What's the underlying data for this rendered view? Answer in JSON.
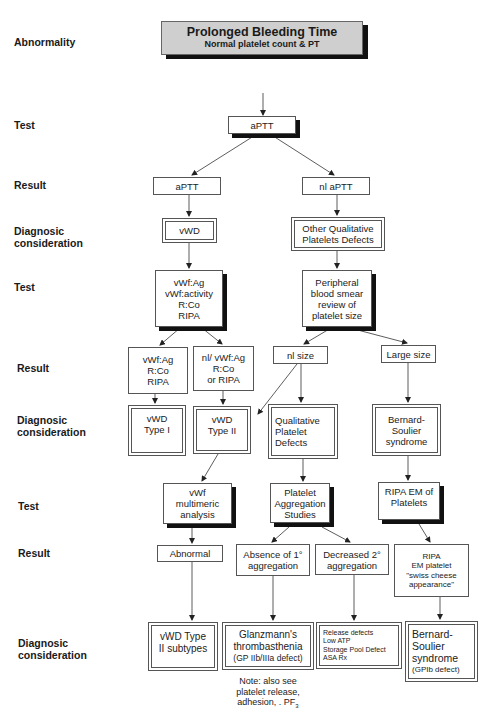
{
  "title": {
    "main": "Prolonged Bleeding Time",
    "sub": "Normal platelet count & PT"
  },
  "row_labels": {
    "abnormality": "Abnormality",
    "test1": "Test",
    "result1": "Result",
    "diag1_line1": "Diagnosic",
    "diag1_line2": "consideration",
    "test2": "Test",
    "result2": "Result",
    "diag2_line1": "Diagnosic",
    "diag2_line2": "consideration",
    "test3": "Test",
    "result3": "Result",
    "diag3_line1": "Diagnosic",
    "diag3_line2": "consideration"
  },
  "nodes": {
    "test_aptt": "aPTT",
    "result_aptt": "aPTT",
    "result_nl_aptt": "nl  aPTT",
    "diag_vwd": "vWD",
    "diag_other_qual": [
      "Other Qualitative",
      "Platelets Defects"
    ],
    "test_vwf": [
      "vWf:Ag",
      "vWf:activity",
      "R:Co",
      "RIPA"
    ],
    "test_smear": [
      "Peripheral",
      "blood smear",
      "review of",
      "platelet size"
    ],
    "result_vwf_low": [
      "vWf:Ag",
      "R:Co",
      "RIPA"
    ],
    "result_vwf_nl": [
      "nl/  vWf:Ag",
      "R:Co",
      "or  RIPA"
    ],
    "result_nl_size": "nl size",
    "result_large_size": "Large size",
    "diag_vwd_type1": [
      "vWD",
      "Type I"
    ],
    "diag_vwd_type2": [
      "vWD",
      "Type II"
    ],
    "diag_qual_platelet": [
      "Qualitative",
      "Platelet",
      "Defects"
    ],
    "diag_bernard1": [
      "Bernard-",
      "Soulier",
      "syndrome"
    ],
    "test_multimeric": [
      "vWf",
      "multimeric",
      "analysis"
    ],
    "test_aggregation": [
      "Platelet",
      "Aggregation",
      "Studies"
    ],
    "test_ripa_em": [
      "RIPA EM of",
      "Platelets"
    ],
    "result_abnormal": "Abnormal",
    "result_absence": [
      "Absence of  1°",
      "aggregation"
    ],
    "result_decreased": [
      "Decreased  2°",
      "aggregation"
    ],
    "result_ripa_em": [
      "RIPA",
      "EM   platelet",
      "\"swiss cheese",
      "appearance\""
    ],
    "diag_vwd_subtypes": [
      "vWD  Type",
      "II  subtypes"
    ],
    "diag_glanzmann": [
      "Glanzmann's",
      "thrombasthenia",
      "(GP IIb/IIIa defect)"
    ],
    "diag_release": [
      "Release defects",
      "Low ATP",
      "Storage Pool Defect",
      "ASA Rx"
    ],
    "diag_bernard2": [
      "Bernard-",
      "Soulier",
      "syndrome",
      "(GPIb defect)"
    ]
  },
  "note": {
    "line1": "Note: also see",
    "line2": "platelet release,",
    "line3": "adhesion,  . PF",
    "subscript": "3"
  }
}
